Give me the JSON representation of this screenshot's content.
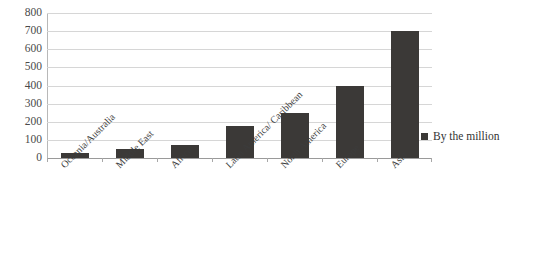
{
  "chart_data": {
    "type": "bar",
    "title": "",
    "subtitle": "",
    "xlabel": "",
    "ylabel": "",
    "ylim": [
      0,
      800
    ],
    "ytick_step": 100,
    "yticks": [
      800,
      700,
      600,
      500,
      400,
      300,
      200,
      100,
      0
    ],
    "grid": true,
    "legend_position": "right",
    "categories": [
      "Oceania/Australia",
      "Middle East",
      "Africa",
      "Latin America/ Caribbean",
      "North America",
      "Europe",
      "Asia"
    ],
    "series": [
      {
        "name": "By the million",
        "color": "#3b3937",
        "values": [
          25,
          50,
          70,
          175,
          250,
          400,
          700
        ]
      }
    ]
  },
  "legend": {
    "marker_name": "legend-color-swatch",
    "entries": [
      {
        "label": "By the million",
        "color": "#3b3937"
      }
    ]
  },
  "axes": {
    "y_tick_labels": [
      "800",
      "700",
      "600",
      "500",
      "400",
      "300",
      "200",
      "100",
      "0"
    ],
    "x_tick_labels": [
      "Oceania/Australia",
      "Middle East",
      "Africa",
      "Latin America/ Caribbean",
      "North America",
      "Europe",
      "Asia"
    ]
  },
  "colors": {
    "bar": "#3b3937",
    "gridline": "#d6d6d6",
    "axis": "#b8b8b8",
    "text": "#3c3c3c",
    "background": "#ffffff"
  }
}
